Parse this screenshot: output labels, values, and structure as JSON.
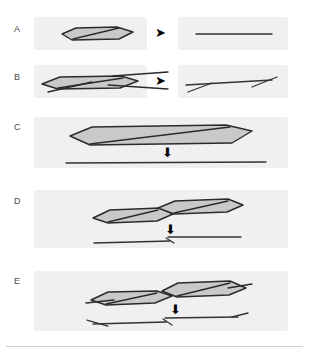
{
  "figure": {
    "background_color": "#ffffff",
    "panel_box_color": "#f0f0f0",
    "shape_fill_color": "#c9c9c9",
    "shape_stroke_color": "#2b2b2b",
    "line_color": "#333333",
    "arrow_color": "#000000",
    "label_color": "#4a4a4a",
    "rule_color": "#cfcfcf"
  },
  "panels": [
    {
      "id": "A",
      "label": "A",
      "label_x": 14,
      "label_y": 24,
      "boxes": [
        {
          "name": "before",
          "x": 34,
          "y": 17,
          "w": 113,
          "h": 33
        },
        {
          "name": "after",
          "x": 178,
          "y": 17,
          "w": 110,
          "h": 33
        }
      ],
      "arrow": {
        "name": "right-arrow",
        "glyph": "➤",
        "x": 155,
        "y": 26
      },
      "shapes": [
        {
          "name": "lens-hexagon",
          "points": "62,34 76,28 117,27 133,32 119,39 72,40",
          "fill": true
        },
        {
          "name": "internal-seam",
          "points": "73,39 119,28"
        }
      ],
      "lines": [
        {
          "name": "resolved-line",
          "points": "196,34 272,34"
        }
      ]
    },
    {
      "id": "B",
      "label": "B",
      "label_x": 14,
      "label_y": 72,
      "boxes": [
        {
          "name": "before",
          "x": 34,
          "y": 65,
          "w": 113,
          "h": 33
        },
        {
          "name": "after",
          "x": 178,
          "y": 65,
          "w": 110,
          "h": 33
        }
      ],
      "arrow": {
        "name": "right-arrow",
        "glyph": "➤",
        "x": 155,
        "y": 74
      },
      "shapes": [
        {
          "name": "lens-hexagon",
          "points": "42,84 60,77 121,76 138,81 120,88 58,89",
          "fill": true
        },
        {
          "name": "internal-seam",
          "points": "58,88 123,78"
        },
        {
          "name": "tail-upper",
          "points": "113,76 168,72"
        },
        {
          "name": "tail-lower",
          "points": "108,85 168,89"
        },
        {
          "name": "tail-left",
          "points": "48,92 92,82"
        }
      ],
      "lines": [
        {
          "name": "resolved-line",
          "points": "186,85 272,80"
        },
        {
          "name": "kink-left",
          "points": "188,92 212,83"
        },
        {
          "name": "kink-right",
          "points": "252,87 277,77"
        }
      ]
    },
    {
      "id": "C",
      "label": "C",
      "label_x": 14,
      "label_y": 122,
      "boxes": [
        {
          "name": "frame",
          "x": 34,
          "y": 117,
          "w": 254,
          "h": 51
        }
      ],
      "arrow": {
        "name": "down-arrow",
        "glyph": "⬇",
        "x": 162,
        "y": 146
      },
      "shapes": [
        {
          "name": "lens-hexagon",
          "points": "70,136 92,127 226,125 252,131 232,143 90,145",
          "fill": true
        },
        {
          "name": "internal-seam",
          "points": "90,144 230,127"
        }
      ],
      "lines": [
        {
          "name": "resolved-line",
          "points": "66,163 266,162"
        }
      ]
    },
    {
      "id": "D",
      "label": "D",
      "label_x": 14,
      "label_y": 196,
      "boxes": [
        {
          "name": "frame",
          "x": 34,
          "y": 190,
          "w": 254,
          "h": 58
        }
      ],
      "arrow": {
        "name": "down-arrow",
        "glyph": "⬇",
        "x": 165,
        "y": 223
      },
      "shapes": [
        {
          "name": "lens-hexagon-left",
          "points": "93,218 110,210 160,208 173,214 157,221 108,223",
          "fill": true
        },
        {
          "name": "internal-seam-left",
          "points": "108,222 158,210"
        },
        {
          "name": "lens-hexagon-right",
          "points": "158,208 175,201 228,199 243,205 227,212 174,214",
          "fill": true
        },
        {
          "name": "internal-seam-right",
          "points": "174,213 228,201"
        }
      ],
      "lines": [
        {
          "name": "lower-line-left",
          "points": "94,243 170,241"
        },
        {
          "name": "upper-line-right",
          "points": "168,237 241,237"
        },
        {
          "name": "junction-stub",
          "points": "166,238 174,243"
        }
      ]
    },
    {
      "id": "E",
      "label": "E",
      "label_x": 14,
      "label_y": 276,
      "boxes": [
        {
          "name": "frame",
          "x": 34,
          "y": 271,
          "w": 254,
          "h": 60
        }
      ],
      "arrow": {
        "name": "down-arrow",
        "glyph": "⬇",
        "x": 170,
        "y": 303
      },
      "shapes": [
        {
          "name": "lens-hexagon-left",
          "points": "91,300 108,292 157,291 172,296 155,303 106,305",
          "fill": true
        },
        {
          "name": "internal-seam-left",
          "points": "106,304 157,293"
        },
        {
          "name": "lens-hexagon-right",
          "points": "162,291 178,283 230,281 246,288 229,295 177,297",
          "fill": true
        },
        {
          "name": "internal-seam-right",
          "points": "177,296 230,283"
        },
        {
          "name": "tail-left",
          "points": "86,303 114,300"
        },
        {
          "name": "tail-right",
          "points": "228,288 252,284"
        }
      ],
      "lines": [
        {
          "name": "lower-line-left",
          "points": "93,324 166,322"
        },
        {
          "name": "upper-line-right",
          "points": "165,318 238,317"
        },
        {
          "name": "fork-left",
          "points": "87,320 108,326"
        },
        {
          "name": "fork-right",
          "points": "232,317 248,313"
        },
        {
          "name": "junction-stub",
          "points": "163,319 172,325"
        }
      ]
    }
  ],
  "footer_rule": {
    "name": "bottom-divider",
    "x": 6,
    "y": 346,
    "w": 297,
    "h": 1
  }
}
